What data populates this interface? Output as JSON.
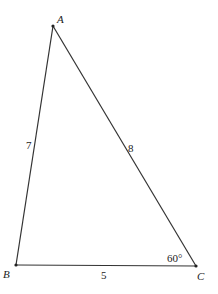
{
  "diagram": {
    "type": "triangle",
    "vertices": {
      "A": {
        "label": "A"
      },
      "B": {
        "label": "B"
      },
      "C": {
        "label": "C"
      }
    },
    "sides": {
      "AB": "7",
      "AC": "8",
      "BC": "5"
    },
    "angle_C": "60°"
  }
}
